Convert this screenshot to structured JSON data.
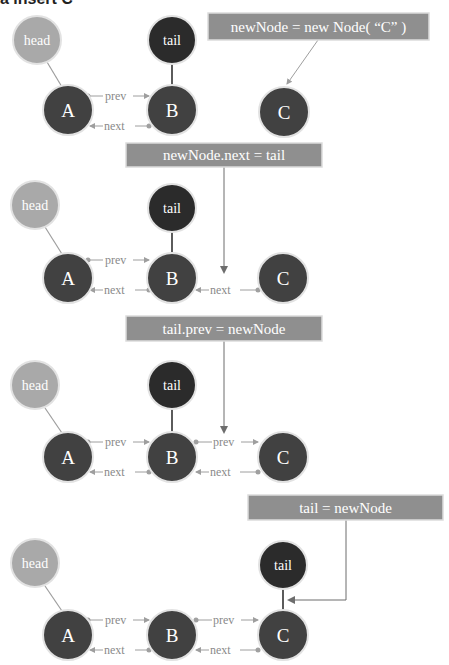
{
  "title": "a insert C",
  "colors": {
    "head_fill": "#a9a9a9",
    "node_fill": "#414141",
    "tail_fill": "#2b2b2b",
    "node_stroke": "#e2e2e2",
    "box_fill": "#8f8f8f",
    "box_stroke": "#dcdcdc",
    "box_text": "#ffffff",
    "link_color": "#9e9e9e",
    "link_label": "#8a8a8a",
    "arrow_dark": "#6d6d6d",
    "dot": "#a0a0a0",
    "node_text": "#ffffff"
  },
  "labels": {
    "head": "head",
    "tail": "tail",
    "prev": "prev",
    "next": "next",
    "node_a": "A",
    "node_b": "B",
    "node_c": "C"
  },
  "steps": [
    {
      "code": "newNode = new Node( “C” )",
      "box": {
        "x": 208,
        "y": 13,
        "w": 221,
        "h": 27
      },
      "head": {
        "cx": 37,
        "cy": 40
      },
      "tail": {
        "cx": 172,
        "cy": 40,
        "points_to": "B"
      },
      "nodes_y": 110,
      "links": []
    },
    {
      "code": "newNode.next = tail",
      "box": {
        "x": 126,
        "y": 143,
        "w": 196,
        "h": 24
      },
      "head": {
        "cx": 35,
        "cy": 205
      },
      "tail": {
        "cx": 172,
        "cy": 208,
        "points_to": "B"
      },
      "nodes_y": 278,
      "links": [
        "C.next -> B"
      ]
    },
    {
      "code": "tail.prev = newNode",
      "box": {
        "x": 126,
        "y": 316,
        "w": 196,
        "h": 25
      },
      "head": {
        "cx": 35,
        "cy": 385
      },
      "tail": {
        "cx": 172,
        "cy": 385,
        "points_to": "B"
      },
      "nodes_y": 457,
      "links": [
        "B.prev -> C",
        "C.next -> B"
      ]
    },
    {
      "code": "tail = newNode",
      "box": {
        "x": 248,
        "y": 495,
        "w": 195,
        "h": 25
      },
      "head": {
        "cx": 35,
        "cy": 563
      },
      "tail": {
        "cx": 283,
        "cy": 565,
        "points_to": "C"
      },
      "nodes_y": 635,
      "links": [
        "B.prev -> C",
        "C.next -> B"
      ]
    }
  ]
}
